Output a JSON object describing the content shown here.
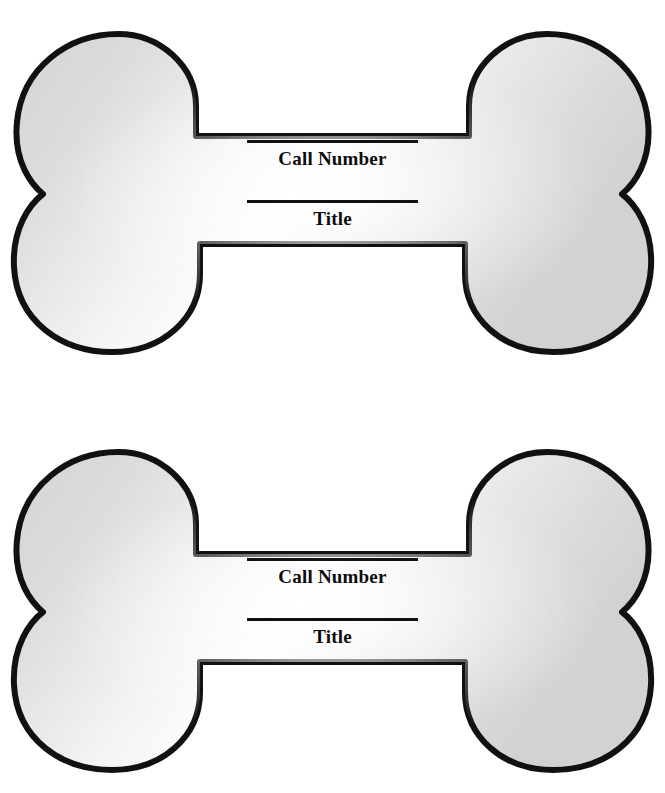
{
  "page": {
    "background_color": "#ffffff",
    "width": 665,
    "height": 793,
    "clipped_header_text": "Book Mark"
  },
  "style": {
    "outline_color": "#111111",
    "fill_center_color": "#fdfdfd",
    "fill_edge_color": "#d6d6d6",
    "text_color": "#0d0d0d",
    "rule_color": "#111111"
  },
  "bookmarks": [
    {
      "name": "bone-bookmark-1",
      "fields": [
        {
          "key": "call_number",
          "label": "Call Number",
          "value": ""
        },
        {
          "key": "title",
          "label": "Title",
          "value": ""
        }
      ]
    },
    {
      "name": "bone-bookmark-2",
      "fields": [
        {
          "key": "call_number",
          "label": "Call Number",
          "value": ""
        },
        {
          "key": "title",
          "label": "Title",
          "value": ""
        }
      ]
    }
  ],
  "labels": {
    "call_number": "Call Number",
    "title": "Title"
  }
}
